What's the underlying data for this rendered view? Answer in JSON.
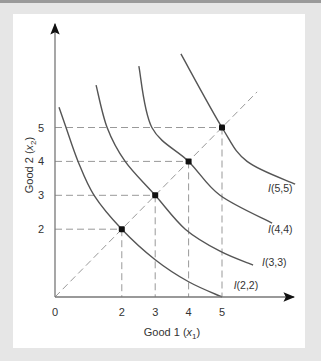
{
  "chart_data": {
    "type": "line",
    "title": "",
    "xlabel": "Good 1 (x1)",
    "ylabel": "Good 2 (x2)",
    "xlabel_main": "Good 1 (",
    "xlabel_var": "x",
    "xlabel_sub": "1",
    "ylabel_main": "Good 2 (",
    "ylabel_var": "x",
    "ylabel_sub": "2",
    "xlim": [
      0,
      7.2
    ],
    "ylim": [
      0,
      8
    ],
    "x_ticks": [
      0,
      2,
      3,
      4,
      5
    ],
    "y_ticks": [
      2,
      3,
      4,
      5
    ],
    "grid": false,
    "diagonal": {
      "from": [
        0,
        0
      ],
      "to": [
        6.05,
        6.05
      ],
      "style": "dashed"
    },
    "points": [
      {
        "x": 2,
        "y": 2
      },
      {
        "x": 3,
        "y": 3
      },
      {
        "x": 4,
        "y": 4
      },
      {
        "x": 5,
        "y": 5
      }
    ],
    "series": [
      {
        "name": "I(2,2)",
        "label_pos": [
          5.35,
          0.25
        ],
        "values": [
          [
            0.12,
            5.6
          ],
          [
            0.33,
            5.0
          ],
          [
            0.69,
            4.0
          ],
          [
            1.17,
            3.0
          ],
          [
            2.0,
            2.0
          ],
          [
            3.0,
            1.1
          ],
          [
            4.0,
            0.45
          ],
          [
            5.0,
            0.0
          ]
        ]
      },
      {
        "name": "I(3,3)",
        "label_pos": [
          6.2,
          0.9
        ],
        "values": [
          [
            1.23,
            6.25
          ],
          [
            1.56,
            5.0
          ],
          [
            2.1,
            4.0
          ],
          [
            3.0,
            3.0
          ],
          [
            3.9,
            2.0
          ],
          [
            4.94,
            1.35
          ],
          [
            5.93,
            0.94
          ]
        ]
      },
      {
        "name": "I(4,4)",
        "label_pos": [
          6.38,
          1.9
        ],
        "values": [
          [
            2.51,
            6.81
          ],
          [
            2.9,
            5.0
          ],
          [
            4.0,
            4.0
          ],
          [
            4.94,
            3.0
          ],
          [
            6.5,
            2.18
          ]
        ]
      },
      {
        "name": "I(5,5)",
        "label_pos": [
          6.38,
          3.1
        ],
        "values": [
          [
            3.77,
            7.17
          ],
          [
            5.0,
            5.0
          ],
          [
            5.75,
            4.0
          ],
          [
            7.19,
            3.33
          ]
        ]
      }
    ],
    "colors": {
      "curve": "#555555",
      "dash": "#999999",
      "axis": "#777777",
      "point": "#111111"
    }
  }
}
